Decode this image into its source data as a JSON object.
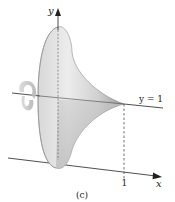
{
  "figure": {
    "caption": "(c)",
    "axes": {
      "x_label": "x",
      "y_label": "y",
      "x_tick": "1"
    },
    "line_label": "y = 1",
    "colors": {
      "surface_light": "#e6e6e6",
      "surface_dark": "#9a9a9a",
      "lines": "#222222",
      "rotation_arrow": "#bdbdbd"
    }
  }
}
